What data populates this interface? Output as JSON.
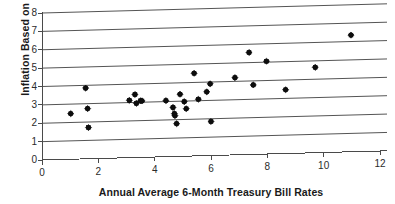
{
  "chart_data": {
    "type": "scatter",
    "title": "",
    "xlabel": "Annual Average 6-Month Treasury Bill Rates",
    "ylabel": "Inflation Based on CPI",
    "xlim": [
      0,
      12
    ],
    "ylim": [
      0,
      8
    ],
    "xticks": [
      0,
      2,
      4,
      6,
      8,
      10,
      12
    ],
    "yticks": [
      0,
      1,
      2,
      3,
      4,
      5,
      6,
      7,
      8
    ],
    "xtick_labels": [
      "0",
      "2",
      "4",
      "6",
      "8",
      "10",
      "12"
    ],
    "ytick_labels": [
      "0",
      "1",
      "2",
      "3",
      "4",
      "5",
      "6",
      "7",
      "8"
    ],
    "grid": "horizontal",
    "legend": "none",
    "marker": "filled-diamond",
    "marker_color": "#0d0d0d",
    "gridline_color": "#555555",
    "axis_color": "#4a4a4a",
    "points": [
      {
        "x": 1.02,
        "y": 2.48
      },
      {
        "x": 1.55,
        "y": 3.85
      },
      {
        "x": 1.62,
        "y": 2.73
      },
      {
        "x": 1.65,
        "y": 1.7
      },
      {
        "x": 3.1,
        "y": 3.12
      },
      {
        "x": 3.3,
        "y": 3.43
      },
      {
        "x": 3.35,
        "y": 2.95
      },
      {
        "x": 3.5,
        "y": 3.08
      },
      {
        "x": 3.55,
        "y": 3.07
      },
      {
        "x": 4.4,
        "y": 3.05
      },
      {
        "x": 4.65,
        "y": 2.67
      },
      {
        "x": 4.7,
        "y": 2.33
      },
      {
        "x": 4.72,
        "y": 2.22
      },
      {
        "x": 4.78,
        "y": 1.78
      },
      {
        "x": 4.9,
        "y": 3.38
      },
      {
        "x": 5.05,
        "y": 2.97
      },
      {
        "x": 5.12,
        "y": 2.58
      },
      {
        "x": 5.4,
        "y": 4.5
      },
      {
        "x": 5.55,
        "y": 3.08
      },
      {
        "x": 5.85,
        "y": 3.47
      },
      {
        "x": 5.97,
        "y": 3.9
      },
      {
        "x": 6.0,
        "y": 1.85
      },
      {
        "x": 6.85,
        "y": 4.2
      },
      {
        "x": 7.35,
        "y": 5.55
      },
      {
        "x": 7.5,
        "y": 3.78
      },
      {
        "x": 7.97,
        "y": 5.05
      },
      {
        "x": 8.65,
        "y": 3.47
      },
      {
        "x": 9.7,
        "y": 4.65
      },
      {
        "x": 10.97,
        "y": 6.35
      }
    ]
  }
}
